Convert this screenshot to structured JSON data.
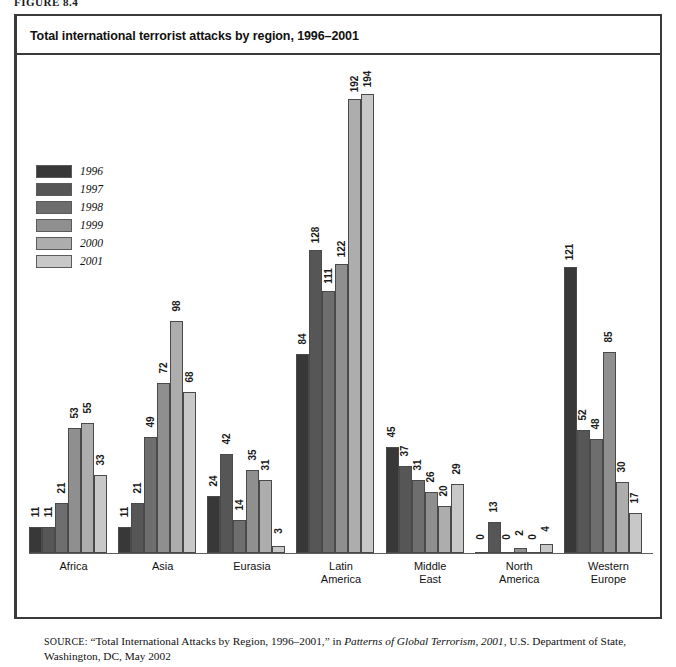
{
  "top_caption": "FIGURE 8.4",
  "figure": {
    "title": "Total international terrorist attacks by region, 1996–2001",
    "source_prefix": "SOURCE:",
    "source_quote": "“Total International Attacks by Region, 1996–2001,”",
    "source_mid": " in ",
    "source_italic": "Patterns of Global Terrorism, 2001",
    "source_tail": ", U.S. Department of State, Washington, DC, May 2002"
  },
  "legend": {
    "items": [
      {
        "label": "1996",
        "color": "#383838"
      },
      {
        "label": "1997",
        "color": "#565656"
      },
      {
        "label": "1998",
        "color": "#6e6e6e"
      },
      {
        "label": "1999",
        "color": "#8f8f8f"
      },
      {
        "label": "2000",
        "color": "#adadad"
      },
      {
        "label": "2001",
        "color": "#c8c8c8"
      }
    ]
  },
  "chart_data": {
    "type": "bar",
    "title": "Total international terrorist attacks by region, 1996–2001",
    "xlabel": "",
    "ylabel": "",
    "ylim": [
      0,
      200
    ],
    "grid": false,
    "legend_position": "upper-left",
    "value_labels": true,
    "categories": [
      "Africa",
      "Asia",
      "Eurasia",
      "Latin America",
      "Middle East",
      "North America",
      "Western Europe"
    ],
    "category_lines": [
      [
        "Africa"
      ],
      [
        "Asia"
      ],
      [
        "Eurasia"
      ],
      [
        "Latin",
        "America"
      ],
      [
        "Middle",
        "East"
      ],
      [
        "North",
        "America"
      ],
      [
        "Western",
        "Europe"
      ]
    ],
    "series": [
      {
        "name": "1996",
        "color": "#383838",
        "values": [
          11,
          11,
          24,
          84,
          45,
          0,
          121
        ]
      },
      {
        "name": "1997",
        "color": "#565656",
        "values": [
          11,
          21,
          42,
          128,
          37,
          13,
          52
        ]
      },
      {
        "name": "1998",
        "color": "#6e6e6e",
        "values": [
          21,
          49,
          14,
          111,
          31,
          0,
          48
        ]
      },
      {
        "name": "1999",
        "color": "#8f8f8f",
        "values": [
          53,
          72,
          35,
          122,
          26,
          2,
          85
        ]
      },
      {
        "name": "2000",
        "color": "#adadad",
        "values": [
          55,
          98,
          31,
          192,
          20,
          0,
          30
        ]
      },
      {
        "name": "2001",
        "color": "#c8c8c8",
        "values": [
          33,
          68,
          3,
          194,
          29,
          4,
          17
        ]
      }
    ]
  }
}
